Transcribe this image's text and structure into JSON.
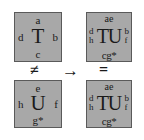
{
  "figure": {
    "type": "tile-composition-diagram",
    "background_color": "#ffffff",
    "tile_fill_color": "#a8a8a8",
    "tile_border_color": "#5a5a5a",
    "text_color": "#1a1a1a"
  },
  "tiles": {
    "top_left": {
      "name": "tile-T",
      "center": "T",
      "north": "a",
      "west": "d",
      "east": "b",
      "south": "c"
    },
    "bottom_left": {
      "name": "tile-U",
      "center": "U",
      "north": "e",
      "west": "h",
      "east": "f",
      "south": "g*"
    },
    "top_right": {
      "name": "tile-TU-merged-top",
      "center": "TU",
      "north": "ae",
      "west_upper": "d",
      "west_lower": "h",
      "east_upper": "b",
      "east_lower": "f",
      "south": "cg*"
    },
    "bottom_right": {
      "name": "tile-TU-merged-bottom",
      "center": "TU",
      "north": "ae",
      "west_upper": "d",
      "west_lower": "h",
      "east_upper": "b",
      "east_lower": "f",
      "south": "cg*"
    }
  },
  "symbols": {
    "not_equal": "≠",
    "arrow": "→",
    "equal": "="
  },
  "glyphs": {
    "star": "*",
    "south_left_base": "g",
    "south_right_base": "cg"
  }
}
